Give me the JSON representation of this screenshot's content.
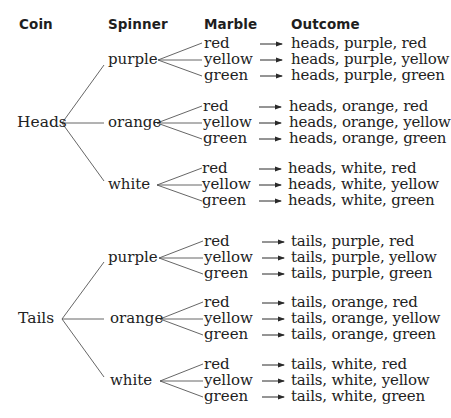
{
  "headers": {
    "coin": "Coin",
    "spinner": "Spinner",
    "marble": "Marble",
    "outcome": "Outcome"
  },
  "arrow_icon": "right-arrow",
  "tree": [
    {
      "coin": "Heads",
      "spinners": [
        {
          "spinner": "purple",
          "marbles": [
            "red",
            "yellow",
            "green"
          ],
          "outcomes": [
            "heads, purple, red",
            "heads, purple, yellow",
            "heads, purple, green"
          ]
        },
        {
          "spinner": "orange",
          "marbles": [
            "red",
            "yellow",
            "green"
          ],
          "outcomes": [
            "heads, orange, red",
            "heads, orange, yellow",
            "heads, orange, green"
          ]
        },
        {
          "spinner": "white",
          "marbles": [
            "red",
            "yellow",
            "green"
          ],
          "outcomes": [
            "heads, white, red",
            "heads, white, yellow",
            "heads, white, green"
          ]
        }
      ]
    },
    {
      "coin": "Tails",
      "spinners": [
        {
          "spinner": "purple",
          "marbles": [
            "red",
            "yellow",
            "green"
          ],
          "outcomes": [
            "tails, purple, red",
            "tails, purple, yellow",
            "tails, purple, green"
          ]
        },
        {
          "spinner": "orange",
          "marbles": [
            "red",
            "yellow",
            "green"
          ],
          "outcomes": [
            "tails, orange, red",
            "tails, orange, yellow",
            "tails, orange, green"
          ]
        },
        {
          "spinner": "white",
          "marbles": [
            "red",
            "yellow",
            "green"
          ],
          "outcomes": [
            "tails, white, red",
            "tails, white, yellow",
            "tails, white, green"
          ]
        }
      ]
    }
  ]
}
